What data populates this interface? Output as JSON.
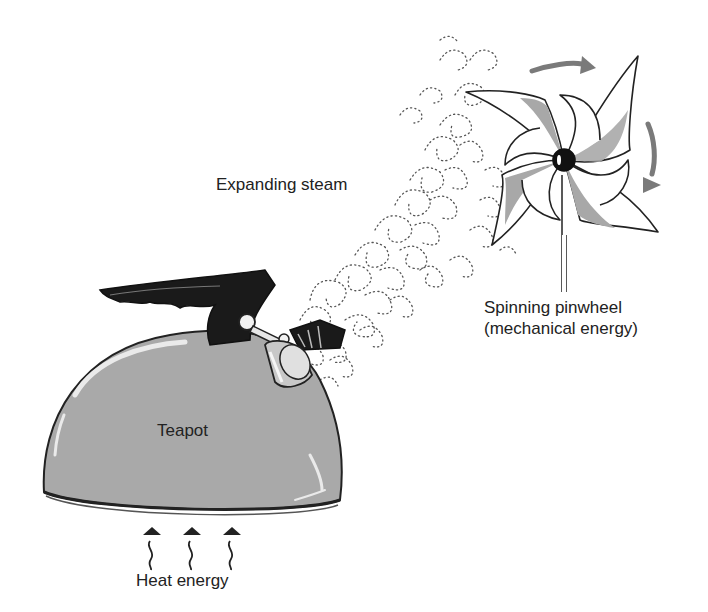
{
  "labels": {
    "steam": "Expanding steam",
    "teapot": "Teapot",
    "pinwheel_line1": "Spinning pinwheel",
    "pinwheel_line2": "(mechanical energy)",
    "heat": "Heat energy"
  },
  "colors": {
    "teapot_body": "#a9a9a9",
    "teapot_highlight": "#e6e6e6",
    "handle": "#1a1a1a",
    "outline": "#222222",
    "pinwheel_band": "#a8a8a8",
    "arrow_gray": "#7a7a7a",
    "steam_dots": "#555555",
    "background": "#ffffff"
  },
  "elements": {
    "heat_arrows_count": 3,
    "rotation_arrows_count": 2,
    "pinwheel_blades": 4
  }
}
